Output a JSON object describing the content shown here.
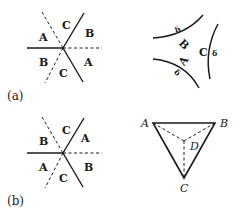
{
  "figure": {
    "panels": [
      {
        "id": "a",
        "label": "(a)",
        "left_diagram": {
          "description": "Six rays from a central point; solid and dashed lines alternate",
          "sector_labels": [
            "C",
            "B",
            "A",
            "C",
            "B",
            "A"
          ]
        },
        "right_diagram": {
          "description": "Three concave arcs bounding a curved triangle",
          "arc_labels": [
            "B",
            "A",
            "C"
          ],
          "delta_marks": [
            "δ",
            "δ",
            "δ"
          ]
        }
      },
      {
        "id": "b",
        "label": "(b)",
        "left_diagram": {
          "description": "Six rays from a central point; solid and dashed lines alternate",
          "sector_labels": [
            "C",
            "A",
            "B",
            "C",
            "A",
            "B"
          ]
        },
        "right_diagram": {
          "description": "Triangle ABC with interior point D joined by dashed lines",
          "vertex_labels": [
            "A",
            "B",
            "C",
            "D"
          ]
        }
      }
    ],
    "colors": {
      "line": "#1a1a1a",
      "background": "#ffffff"
    }
  }
}
